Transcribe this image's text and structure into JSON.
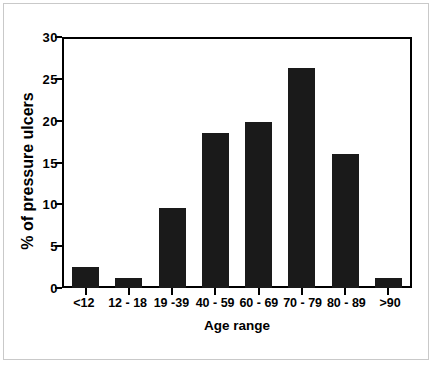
{
  "chart_data": {
    "type": "bar",
    "title": "",
    "xlabel": "Age range",
    "ylabel": "% of pressure ulcers",
    "categories": [
      "<12",
      "12 - 18",
      "19 -39",
      "40 - 59",
      "60 - 69",
      "70 - 79",
      "80 - 89",
      ">90"
    ],
    "values": [
      2.5,
      1.2,
      9.6,
      18.7,
      20.0,
      26.5,
      16.1,
      1.2
    ],
    "ylim": [
      0,
      30
    ],
    "yticks": [
      0,
      5,
      10,
      15,
      20,
      25,
      30
    ],
    "ytick_labels": [
      "0",
      "5",
      "10",
      "15",
      "20",
      "25",
      "30"
    ],
    "grid": false,
    "legend": null,
    "bar_color": "#1a1a1a",
    "axis_color": "#000000",
    "background": "#ffffff"
  }
}
